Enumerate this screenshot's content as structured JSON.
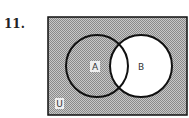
{
  "problem_number": "11.",
  "diagram": {
    "type": "venn",
    "sets": [
      "A",
      "B"
    ],
    "universe_label": "U",
    "label_a": "A",
    "label_b": "B",
    "shaded_region": "complement of B (A only and outside both)",
    "colors": {
      "shade": "#a8a8a8",
      "outline": "#111111",
      "background": "#ffffff"
    }
  }
}
